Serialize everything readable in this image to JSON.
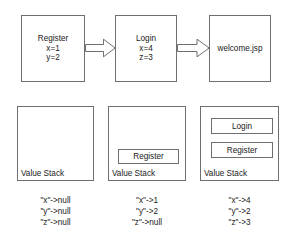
{
  "diagram": {
    "colors": {
      "stroke": "#6f6f6f",
      "background": "#ffffff",
      "text": "#1a1a1a"
    },
    "flow": {
      "nodes": [
        {
          "id": "register",
          "lines": [
            "Register",
            "x=1",
            "y=2"
          ],
          "name": "Register",
          "params": [
            "x=1",
            "y=2"
          ]
        },
        {
          "id": "login",
          "lines": [
            "Login",
            "x=4",
            "z=3"
          ],
          "name": "Login",
          "params": [
            "x=4",
            "z=3"
          ]
        },
        {
          "id": "welcome",
          "lines": [
            "welcome.jsp"
          ],
          "name": "welcome.jsp",
          "params": []
        }
      ],
      "arrows": [
        {
          "id": "arrow-1",
          "from": "register",
          "to": "login"
        },
        {
          "id": "arrow-2",
          "from": "login",
          "to": "welcome"
        }
      ]
    },
    "stacks": [
      {
        "id": "stack-1",
        "label": "Value Stack",
        "frames": [],
        "annotation": [
          "\"x\"->null",
          "\"y\"->null",
          "\"z\"->null"
        ]
      },
      {
        "id": "stack-2",
        "label": "Value Stack",
        "frames": [
          "Register"
        ],
        "annotation": [
          "\"x\"->1",
          "\"y\"->2",
          "\"z\"->null"
        ]
      },
      {
        "id": "stack-3",
        "label": "Value Stack",
        "frames": [
          "Login",
          "Register"
        ],
        "annotation": [
          "\"x\"->4",
          "\"y\"->2",
          "\"z\"->3"
        ]
      }
    ]
  }
}
